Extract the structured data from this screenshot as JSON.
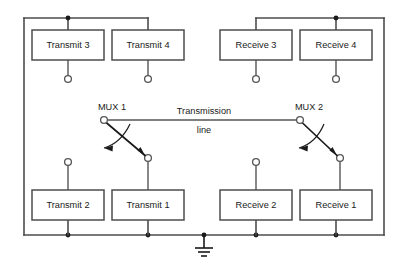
{
  "diagram": {
    "type": "circuit-schematic",
    "colors": {
      "wire": "#4d4d4d",
      "text": "#1a1a1a",
      "background": "#ffffff",
      "junction": "#1a1a1a"
    },
    "blocks": [
      {
        "id": "transmit-3",
        "label": "Transmit 3",
        "group": "transmit",
        "row": "top",
        "x": 32,
        "y": 30,
        "w": 72,
        "h": 30
      },
      {
        "id": "transmit-4",
        "label": "Transmit 4",
        "group": "transmit",
        "row": "top",
        "x": 112,
        "y": 30,
        "w": 72,
        "h": 30
      },
      {
        "id": "receive-3",
        "label": "Receive 3",
        "group": "receive",
        "row": "top",
        "x": 220,
        "y": 30,
        "w": 72,
        "h": 30
      },
      {
        "id": "receive-4",
        "label": "Receive 4",
        "group": "receive",
        "row": "top",
        "x": 300,
        "y": 30,
        "w": 72,
        "h": 30
      },
      {
        "id": "transmit-2",
        "label": "Transmit 2",
        "group": "transmit",
        "row": "bottom",
        "x": 32,
        "y": 190,
        "w": 72,
        "h": 30
      },
      {
        "id": "transmit-1",
        "label": "Transmit 1",
        "group": "transmit",
        "row": "bottom",
        "x": 112,
        "y": 190,
        "w": 72,
        "h": 30
      },
      {
        "id": "receive-2",
        "label": "Receive 2",
        "group": "receive",
        "row": "bottom",
        "x": 220,
        "y": 190,
        "w": 72,
        "h": 30
      },
      {
        "id": "receive-1",
        "label": "Receive 1",
        "group": "receive",
        "row": "bottom",
        "x": 300,
        "y": 190,
        "w": 72,
        "h": 30
      }
    ],
    "switches": [
      {
        "id": "mux-1",
        "label": "MUX 1",
        "pivot_x": 104,
        "pivot_y": 120,
        "throw_x": 148,
        "throw_y": 158
      },
      {
        "id": "mux-2",
        "label": "MUX 2",
        "pivot_x": 300,
        "pivot_y": 120,
        "throw_x": 340,
        "throw_y": 158
      }
    ],
    "transmission_line": {
      "label_top": "Transmission",
      "label_bottom": "line",
      "x1": 104,
      "x2": 300,
      "y": 120
    },
    "ground": {
      "label": "ground-symbol",
      "x": 204,
      "y": 235
    },
    "rails": {
      "top_left_y": 18,
      "top_right_y": 18,
      "bottom_y": 235,
      "left_x": 24,
      "right_x": 384
    }
  }
}
